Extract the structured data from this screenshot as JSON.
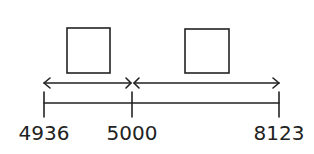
{
  "diagram": {
    "type": "number-line-jumps",
    "colors": {
      "stroke": "#222222",
      "background": "#ffffff"
    },
    "ticks": [
      {
        "label": "4936",
        "x": 44
      },
      {
        "label": "5000",
        "x": 132
      },
      {
        "label": "8123",
        "x": 279
      }
    ],
    "jumps": [
      {
        "from": "4936",
        "to": "5000",
        "answer_box": ""
      },
      {
        "from": "5000",
        "to": "8123",
        "answer_box": ""
      }
    ]
  }
}
